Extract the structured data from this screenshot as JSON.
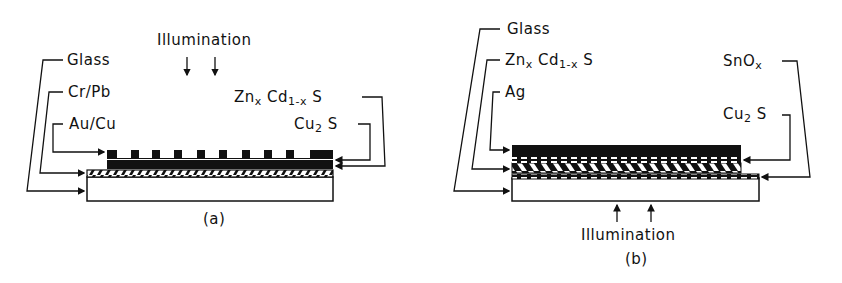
{
  "panel_a": {
    "caption": "(a)",
    "illumination": "Illumination",
    "labels": {
      "glass": "Glass",
      "cr_pb": "Cr/Pb",
      "au_cu": "Au/Cu",
      "zncds_main": "Zn",
      "zncds_x": "x",
      "zncds_cd": " Cd",
      "zncds_sub": "1-x",
      "zncds_s": " S",
      "cu2s_main": "Cu",
      "cu2s_sub": "2",
      "cu2s_s": " S"
    }
  },
  "panel_b": {
    "caption": "(b)",
    "illumination": "Illumination",
    "labels": {
      "glass": "Glass",
      "zncds_main": "Zn",
      "zncds_x": "x",
      "zncds_cd": " Cd",
      "zncds_sub": "1-x",
      "zncds_s": " S",
      "ag": "Ag",
      "snox_main": "SnO",
      "snox_sub": "x",
      "cu2s_main": "Cu",
      "cu2s_sub": "2",
      "cu2s_s": " S"
    }
  },
  "colors": {
    "ink": "#111111",
    "background": "#ffffff"
  }
}
